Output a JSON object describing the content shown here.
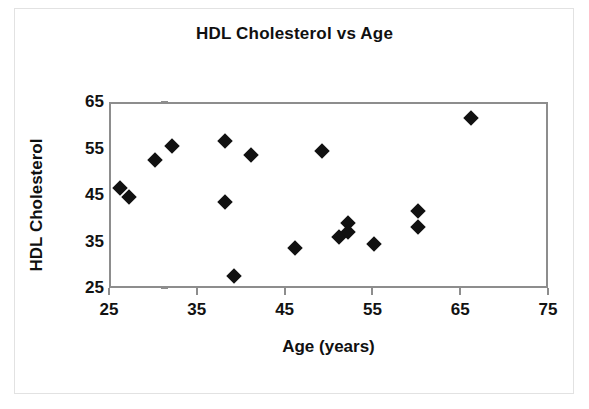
{
  "chart_data": {
    "type": "scatter",
    "title": "HDL Cholesterol vs Age",
    "xlabel": "Age (years)",
    "ylabel": "HDL Cholesterol",
    "xlim": [
      25,
      75
    ],
    "ylim": [
      25,
      65
    ],
    "xticks": [
      25,
      35,
      45,
      55,
      65,
      75
    ],
    "yticks": [
      25,
      35,
      45,
      55,
      65
    ],
    "grid": false,
    "legend": null,
    "marker": "diamond",
    "marker_color": "#111111",
    "frame_color": "#8d8d8d",
    "points": [
      {
        "x": 26,
        "y": 47
      },
      {
        "x": 27,
        "y": 45
      },
      {
        "x": 30,
        "y": 53
      },
      {
        "x": 32,
        "y": 56
      },
      {
        "x": 38,
        "y": 57
      },
      {
        "x": 38,
        "y": 44
      },
      {
        "x": 39,
        "y": 28
      },
      {
        "x": 41,
        "y": 54
      },
      {
        "x": 46,
        "y": 34
      },
      {
        "x": 49,
        "y": 55
      },
      {
        "x": 51,
        "y": 36.5
      },
      {
        "x": 52,
        "y": 39.5
      },
      {
        "x": 52,
        "y": 37.5
      },
      {
        "x": 55,
        "y": 35
      },
      {
        "x": 60,
        "y": 42
      },
      {
        "x": 60,
        "y": 38.5
      },
      {
        "x": 66,
        "y": 62
      }
    ]
  }
}
